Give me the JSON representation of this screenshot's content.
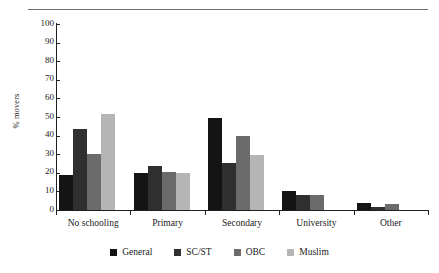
{
  "chart_data": {
    "type": "bar",
    "title": "",
    "xlabel": "",
    "ylabel": "% movers",
    "ylim": [
      0,
      100
    ],
    "yticks": [
      0,
      10,
      20,
      30,
      40,
      50,
      60,
      70,
      80,
      90,
      100
    ],
    "grid": false,
    "legend_position": "bottom",
    "categories": [
      "No schooling",
      "Primary",
      "Secondary",
      "University",
      "Other"
    ],
    "series": [
      {
        "name": "General",
        "color": "#141414",
        "values": [
          19,
          20,
          49.5,
          10.3,
          3.7
        ]
      },
      {
        "name": "SC/ST",
        "color": "#2f2f2f",
        "values": [
          43.5,
          23.5,
          25.5,
          8,
          1.5
        ]
      },
      {
        "name": "OBC",
        "color": "#6b6b6b",
        "values": [
          30,
          20.5,
          40,
          8,
          3
        ]
      },
      {
        "name": "Muslim",
        "color": "#b5b5b5",
        "values": [
          51.5,
          20,
          29.5,
          0,
          0
        ]
      }
    ]
  },
  "axis": {
    "tick_0": "0",
    "tick_10": "10",
    "tick_20": "20",
    "tick_30": "30",
    "tick_40": "40",
    "tick_50": "50",
    "tick_60": "60",
    "tick_70": "70",
    "tick_80": "80",
    "tick_90": "90",
    "tick_100": "100"
  },
  "labels": {
    "cat_0": "No schooling",
    "cat_1": "Primary",
    "cat_2": "Secondary",
    "cat_3": "University",
    "cat_4": "Other"
  },
  "legend": {
    "item_0": "General",
    "item_1": "SC/ST",
    "item_2": "OBC",
    "item_3": "Muslim"
  }
}
